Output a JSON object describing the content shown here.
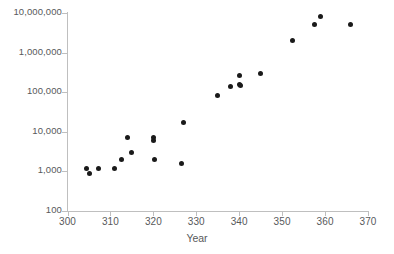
{
  "chart_data": {
    "type": "scatter",
    "title": "",
    "xlabel": "Year",
    "ylabel": "",
    "xlim": [
      300,
      370
    ],
    "ylim": [
      100,
      10000000
    ],
    "yscale": "log",
    "xscale": "linear",
    "grid": false,
    "legend": null,
    "marker": {
      "shape": "circle",
      "color": "#1a1a1a",
      "size_px": 5
    },
    "axis_color": "#bfbfbf",
    "tick_label_color": "#58595b",
    "xticks": [
      300,
      310,
      320,
      330,
      340,
      350,
      360,
      370
    ],
    "xtick_labels": [
      "300",
      "310",
      "320",
      "330",
      "340",
      "350",
      "360",
      "370"
    ],
    "yticks": [
      100,
      1000,
      10000,
      100000,
      1000000,
      10000000
    ],
    "ytick_labels": [
      "100",
      "1,000",
      "10,000",
      "100,000",
      "1,000,000",
      "10,000,000"
    ],
    "points": [
      {
        "x": 304.3,
        "y": 1200
      },
      {
        "x": 305.0,
        "y": 880
      },
      {
        "x": 307.3,
        "y": 1200
      },
      {
        "x": 311.0,
        "y": 1200
      },
      {
        "x": 312.5,
        "y": 1950
      },
      {
        "x": 314.0,
        "y": 7000
      },
      {
        "x": 315.0,
        "y": 3000
      },
      {
        "x": 320.0,
        "y": 7000
      },
      {
        "x": 320.0,
        "y": 6000
      },
      {
        "x": 320.2,
        "y": 2000
      },
      {
        "x": 326.5,
        "y": 1600
      },
      {
        "x": 327.0,
        "y": 17000
      },
      {
        "x": 335.0,
        "y": 85000
      },
      {
        "x": 338.0,
        "y": 140000
      },
      {
        "x": 340.0,
        "y": 270000
      },
      {
        "x": 340.0,
        "y": 160000
      },
      {
        "x": 340.2,
        "y": 150000
      },
      {
        "x": 345.0,
        "y": 300000
      },
      {
        "x": 352.3,
        "y": 2000000
      },
      {
        "x": 357.5,
        "y": 5000000
      },
      {
        "x": 359.0,
        "y": 8200000
      },
      {
        "x": 366.0,
        "y": 5000000
      }
    ]
  }
}
